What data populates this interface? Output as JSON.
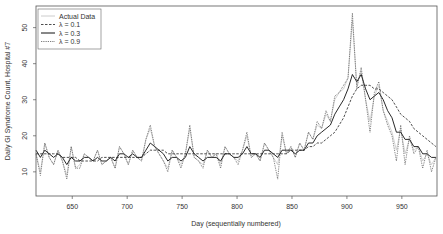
{
  "chart_data": {
    "type": "line",
    "title": "",
    "xlabel": "Day (sequentially numbered)",
    "ylabel": "Daily GI Syndrome Count, Hospital #7",
    "xlim": [
      617,
      982
    ],
    "ylim": [
      3.3,
      56
    ],
    "xticks": [
      650,
      700,
      750,
      800,
      850,
      900,
      950
    ],
    "yticks": [
      10,
      20,
      30,
      40,
      50
    ],
    "grid": false,
    "legend_position": "top-left",
    "legend": [
      {
        "label": "Actual Data",
        "style": "solid-light"
      },
      {
        "label": "λ = 0.1",
        "style": "dashed"
      },
      {
        "label": "λ = 0.3",
        "style": "solid"
      },
      {
        "label": "λ = 0.9",
        "style": "dotted"
      }
    ],
    "x": [
      617,
      621,
      625,
      629,
      633,
      637,
      641,
      645,
      649,
      653,
      657,
      661,
      665,
      669,
      673,
      677,
      681,
      685,
      689,
      693,
      697,
      701,
      705,
      709,
      713,
      717,
      721,
      725,
      729,
      733,
      737,
      741,
      745,
      749,
      753,
      757,
      761,
      765,
      769,
      773,
      777,
      781,
      785,
      789,
      793,
      797,
      801,
      805,
      809,
      813,
      817,
      821,
      825,
      829,
      833,
      837,
      841,
      845,
      849,
      853,
      857,
      861,
      865,
      869,
      873,
      877,
      881,
      885,
      889,
      893,
      897,
      901,
      905,
      909,
      913,
      917,
      921,
      925,
      929,
      933,
      937,
      941,
      945,
      949,
      953,
      957,
      961,
      965,
      969,
      973,
      977,
      981
    ],
    "series": [
      {
        "name": "Actual Data",
        "values": [
          15,
          10,
          18,
          14,
          12,
          16,
          13,
          9,
          17,
          11,
          12,
          15,
          14,
          13,
          16,
          12,
          13,
          14,
          11,
          17,
          15,
          12,
          16,
          14,
          13,
          19,
          22,
          17,
          15,
          13,
          11,
          16,
          14,
          12,
          15,
          22,
          14,
          13,
          12,
          16,
          14,
          15,
          12,
          17,
          15,
          14,
          13,
          16,
          20,
          14,
          15,
          13,
          18,
          16,
          14,
          12,
          20,
          15,
          17,
          14,
          18,
          16,
          21,
          19,
          23,
          22,
          26,
          24,
          30,
          32,
          33,
          36,
          52,
          34,
          38,
          30,
          24,
          31,
          34,
          27,
          24,
          21,
          16,
          22,
          15,
          19,
          16,
          17,
          13,
          15,
          12,
          14
        ]
      },
      {
        "name": "λ = 0.1",
        "values": [
          15,
          15,
          15,
          15,
          15,
          15,
          14,
          14,
          14,
          14,
          13,
          13,
          13,
          13,
          13,
          14,
          14,
          14,
          14,
          14,
          14,
          14,
          14,
          14,
          14,
          15,
          16,
          16,
          16,
          16,
          15,
          15,
          15,
          15,
          15,
          15,
          15,
          15,
          15,
          15,
          15,
          15,
          15,
          15,
          15,
          15,
          15,
          15,
          15,
          15,
          15,
          15,
          15,
          15,
          15,
          15,
          15,
          15,
          16,
          16,
          16,
          16,
          17,
          17,
          18,
          18,
          19,
          20,
          21,
          23,
          25,
          28,
          31,
          33,
          34,
          34,
          34,
          33,
          33,
          32,
          31,
          30,
          28,
          26,
          25,
          24,
          22,
          21,
          20,
          19,
          18,
          17
        ]
      },
      {
        "name": "λ = 0.3",
        "values": [
          16,
          14,
          16,
          15,
          14,
          15,
          14,
          12,
          14,
          13,
          13,
          14,
          14,
          13,
          14,
          13,
          13,
          14,
          13,
          15,
          15,
          14,
          15,
          14,
          14,
          16,
          18,
          17,
          16,
          15,
          13,
          14,
          14,
          13,
          14,
          17,
          15,
          14,
          13,
          14,
          14,
          14,
          13,
          15,
          15,
          14,
          14,
          15,
          17,
          15,
          15,
          14,
          16,
          16,
          15,
          14,
          16,
          16,
          16,
          15,
          16,
          16,
          18,
          18,
          20,
          21,
          22,
          23,
          26,
          28,
          30,
          33,
          37,
          35,
          37,
          33,
          30,
          31,
          32,
          30,
          27,
          25,
          21,
          21,
          19,
          19,
          17,
          17,
          15,
          15,
          14,
          14
        ]
      },
      {
        "name": "λ = 0.9",
        "values": [
          15,
          9,
          18,
          14,
          12,
          16,
          13,
          8,
          17,
          11,
          11,
          15,
          14,
          13,
          16,
          12,
          13,
          14,
          11,
          17,
          15,
          12,
          16,
          14,
          13,
          19,
          23,
          17,
          15,
          13,
          10,
          16,
          14,
          11,
          15,
          23,
          14,
          13,
          11,
          16,
          14,
          15,
          11,
          17,
          15,
          14,
          12,
          16,
          21,
          14,
          15,
          13,
          18,
          16,
          14,
          8,
          21,
          15,
          17,
          14,
          18,
          16,
          21,
          19,
          24,
          22,
          27,
          24,
          31,
          32,
          34,
          36,
          54,
          33,
          39,
          30,
          21,
          32,
          35,
          27,
          23,
          20,
          13,
          23,
          12,
          20,
          15,
          17,
          11,
          16,
          10,
          14
        ]
      }
    ]
  }
}
